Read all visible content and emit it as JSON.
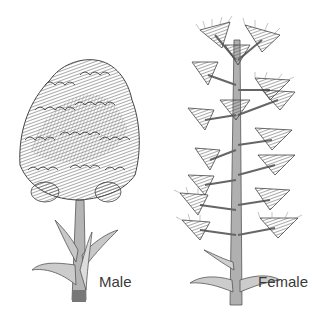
{
  "figure": {
    "plants": [
      {
        "id": "male",
        "label": "Male"
      },
      {
        "id": "female",
        "label": "Female"
      }
    ]
  },
  "colors": {
    "ink": "#4a4a4a",
    "ink_light": "#8a8a8a",
    "stem": "#9a9a9a",
    "background": "#ffffff"
  }
}
